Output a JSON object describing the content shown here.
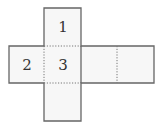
{
  "diagram": {
    "type": "cube-net",
    "faces": [
      {
        "id": "top",
        "label": "1"
      },
      {
        "id": "left",
        "label": "2"
      },
      {
        "id": "center",
        "label": "3"
      },
      {
        "id": "right-1",
        "label": ""
      },
      {
        "id": "right-2",
        "label": ""
      },
      {
        "id": "bottom",
        "label": ""
      }
    ],
    "colors": {
      "face_fill": "#f7f7f7",
      "edge": "#666666",
      "fold_line": "#777777"
    }
  }
}
